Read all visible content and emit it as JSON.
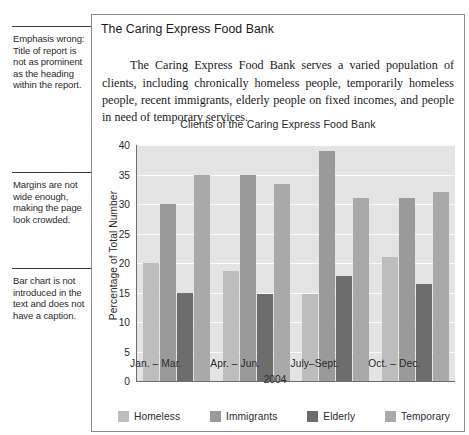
{
  "annotations": [
    {
      "id": "emphasis-wrong",
      "top": 26,
      "text": "Emphasis wrong: Title of report is not as prominent as the heading within the report."
    },
    {
      "id": "margins-narrow",
      "top": 172,
      "text": "Margins are not wide enough, making the page look crowded."
    },
    {
      "id": "chart-not-introduced",
      "top": 268,
      "text": "Bar chart is not introduced in the text and does not have a caption."
    }
  ],
  "report": {
    "heading": "The Caring Express Food Bank",
    "body": "The Caring Express Food Bank serves a varied population of clients, including chronically homeless people, temporarily homeless people, recent immigrants, elderly people on fixed incomes, and people in need of temporary services."
  },
  "chart_data": {
    "type": "bar",
    "title": "Clients of the Caring Express Food Bank",
    "xlabel": "2004",
    "ylabel": "Percentage of Total Number",
    "ylim": [
      0,
      40
    ],
    "yticks": [
      0,
      5,
      10,
      15,
      20,
      25,
      30,
      35,
      40
    ],
    "grid": true,
    "legend_position": "bottom",
    "categories": [
      "Jan. – Mar.",
      "Apr. – Jun.",
      "July–Sept.",
      "Oct. – Dec."
    ],
    "series": [
      {
        "name": "Homeless",
        "color": "#bdbdbd",
        "values": [
          20.0,
          18.7,
          14.7,
          21.0
        ]
      },
      {
        "name": "Immigrants",
        "color": "#9a9a9a",
        "values": [
          30.0,
          35.0,
          39.0,
          31.0
        ]
      },
      {
        "name": "Elderly",
        "color": "#6d6d6d",
        "values": [
          15.0,
          14.7,
          17.8,
          16.4
        ]
      },
      {
        "name": "Temporary",
        "color": "#a9a9a9",
        "values": [
          35.0,
          33.4,
          31.0,
          32.0
        ]
      }
    ]
  },
  "colors": {
    "plot_background": "#e4e4e4",
    "gridline": "#fbfbfb",
    "axis": "#6e6e6e",
    "panel_border": "#8a8a8a",
    "callout_rule": "#3f3f3f"
  }
}
